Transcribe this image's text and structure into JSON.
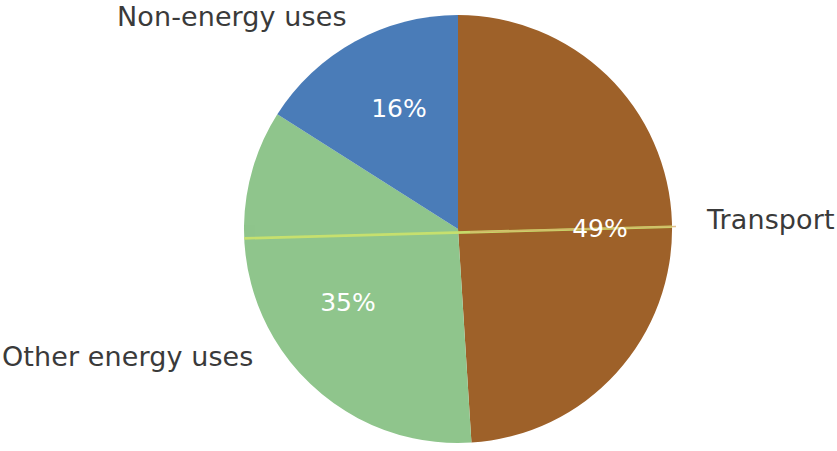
{
  "chart_data": {
    "type": "pie",
    "title": "",
    "subtitle": "",
    "xlabel": "",
    "ylabel": "",
    "grid": false,
    "legend_position": "none",
    "labels_outside": true,
    "unit": "%",
    "categories": [
      "Transport",
      "Other energy uses",
      "Non-energy uses"
    ],
    "values": [
      49,
      35,
      16
    ],
    "slices": [
      {
        "label": "Transport",
        "value": 49,
        "value_text": "49%",
        "color": "#9e6129",
        "label_color": "#3a3a3a",
        "pct_text_color": "#ffffff"
      },
      {
        "label": "Other energy uses",
        "value": 35,
        "value_text": "35%",
        "color": "#8fc58c",
        "label_color": "#3a3a3a",
        "pct_text_color": "#ffffff"
      },
      {
        "label": "Non-energy uses",
        "value": 16,
        "value_text": "16%",
        "color": "#4a7cb8",
        "label_color": "#3a3a3a",
        "pct_text_color": "#ffffff"
      }
    ],
    "colors": {
      "transport": "#9e6129",
      "other_energy_uses": "#8fc58c",
      "non_energy_uses": "#4a7cb8",
      "background": "#ffffff",
      "text": "#3a3a3a",
      "percent_text": "#ffffff",
      "scan_line": "#c8e070"
    },
    "geometry": {
      "center_x": 458,
      "center_y": 229,
      "radius": 214,
      "start_angle_deg": 0,
      "direction": "clockwise"
    },
    "annotations": [
      {
        "name": "scan-line-artifact",
        "description": "thin yellow-green horizontal streak crossing the pie"
      }
    ]
  },
  "labels": {
    "non_energy": "Non-energy uses",
    "other_energy": "Other energy uses",
    "transport": "Transport"
  },
  "percents": {
    "non_energy": "16%",
    "other_energy": "35%",
    "transport": "49%"
  }
}
